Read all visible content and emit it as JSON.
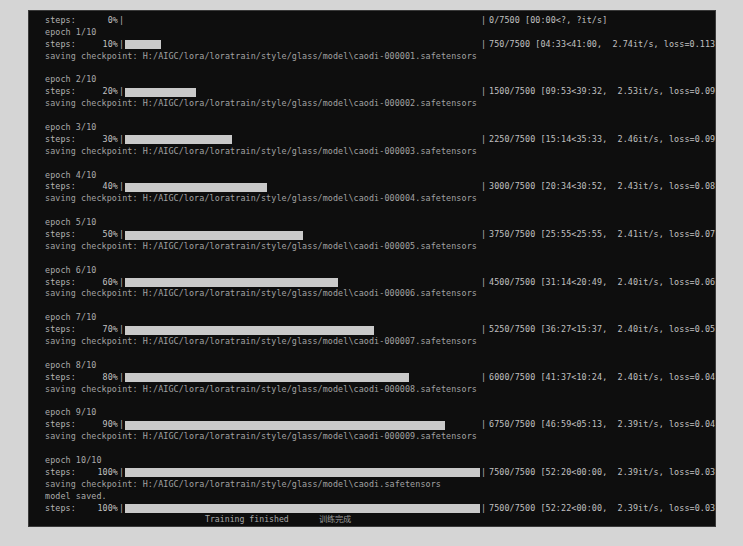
{
  "window": {
    "type": "terminal-console",
    "background_color": "#0e0e0e",
    "text_color": "#b9b9b9",
    "bar_color": "#c9c9c9"
  },
  "log": {
    "entries": [
      {
        "kind": "progress",
        "label": "steps:",
        "percent": "0%",
        "percent_value": 0,
        "bar_left": "|",
        "bar_right": "|",
        "stats": "0/7500 [00:00<?, ?it/s]"
      },
      {
        "kind": "text",
        "style": "epoch",
        "text": "epoch 1/10"
      },
      {
        "kind": "progress",
        "label": "steps:",
        "percent": "10%",
        "percent_value": 10,
        "bar_left": "|",
        "bar_right": "|",
        "stats": "750/7500 [04:33<41:00,  2.74it/s, loss=0.113]"
      },
      {
        "kind": "text",
        "style": "save",
        "text": "saving checkpoint: H:/AIGC/lora/loratrain/style/glass/model\\caodi-000001.safetensors"
      },
      {
        "kind": "blank"
      },
      {
        "kind": "text",
        "style": "epoch",
        "text": "epoch 2/10"
      },
      {
        "kind": "progress",
        "label": "steps:",
        "percent": "20%",
        "percent_value": 20,
        "bar_left": "|",
        "bar_right": "|",
        "stats": "1500/7500 [09:53<39:32,  2.53it/s, loss=0.0978]"
      },
      {
        "kind": "text",
        "style": "save",
        "text": "saving checkpoint: H:/AIGC/lora/loratrain/style/glass/model\\caodi-000002.safetensors"
      },
      {
        "kind": "blank"
      },
      {
        "kind": "text",
        "style": "epoch",
        "text": "epoch 3/10"
      },
      {
        "kind": "progress",
        "label": "steps:",
        "percent": "30%",
        "percent_value": 30,
        "bar_left": "|",
        "bar_right": "|",
        "stats": "2250/7500 [15:14<35:33,  2.46it/s, loss=0.0947]"
      },
      {
        "kind": "text",
        "style": "save",
        "text": "saving checkpoint: H:/AIGC/lora/loratrain/style/glass/model\\caodi-000003.safetensors"
      },
      {
        "kind": "blank"
      },
      {
        "kind": "text",
        "style": "epoch",
        "text": "epoch 4/10"
      },
      {
        "kind": "progress",
        "label": "steps:",
        "percent": "40%",
        "percent_value": 40,
        "bar_left": "|",
        "bar_right": "|",
        "stats": "3000/7500 [20:34<30:52,  2.43it/s, loss=0.0861]"
      },
      {
        "kind": "text",
        "style": "save",
        "text": "saving checkpoint: H:/AIGC/lora/loratrain/style/glass/model\\caodi-000004.safetensors"
      },
      {
        "kind": "blank"
      },
      {
        "kind": "text",
        "style": "epoch",
        "text": "epoch 5/10"
      },
      {
        "kind": "progress",
        "label": "steps:",
        "percent": "50%",
        "percent_value": 50,
        "bar_left": "|",
        "bar_right": "|",
        "stats": "3750/7500 [25:55<25:55,  2.41it/s, loss=0.0733]"
      },
      {
        "kind": "text",
        "style": "save",
        "text": "saving checkpoint: H:/AIGC/lora/loratrain/style/glass/model\\caodi-000005.safetensors"
      },
      {
        "kind": "blank"
      },
      {
        "kind": "text",
        "style": "epoch",
        "text": "epoch 6/10"
      },
      {
        "kind": "progress",
        "label": "steps:",
        "percent": "60%",
        "percent_value": 60,
        "bar_left": "|",
        "bar_right": "|",
        "stats": "4500/7500 [31:14<20:49,  2.40it/s, loss=0.0628]"
      },
      {
        "kind": "text",
        "style": "save",
        "text": "saving checkpoint: H:/AIGC/lora/loratrain/style/glass/model\\caodi-000006.safetensors"
      },
      {
        "kind": "blank"
      },
      {
        "kind": "text",
        "style": "epoch",
        "text": "epoch 7/10"
      },
      {
        "kind": "progress",
        "label": "steps:",
        "percent": "70%",
        "percent_value": 70,
        "bar_left": "|",
        "bar_right": "|",
        "stats": "5250/7500 [36:27<15:37,  2.40it/s, loss=0.0538]"
      },
      {
        "kind": "text",
        "style": "save",
        "text": "saving checkpoint: H:/AIGC/lora/loratrain/style/glass/model\\caodi-000007.safetensors"
      },
      {
        "kind": "blank"
      },
      {
        "kind": "text",
        "style": "epoch",
        "text": "epoch 8/10"
      },
      {
        "kind": "progress",
        "label": "steps:",
        "percent": "80%",
        "percent_value": 80,
        "bar_left": "|",
        "bar_right": "|",
        "stats": "6000/7500 [41:37<10:24,  2.40it/s, loss=0.0487]"
      },
      {
        "kind": "text",
        "style": "save",
        "text": "saving checkpoint: H:/AIGC/lora/loratrain/style/glass/model\\caodi-000008.safetensors"
      },
      {
        "kind": "blank"
      },
      {
        "kind": "text",
        "style": "epoch",
        "text": "epoch 9/10"
      },
      {
        "kind": "progress",
        "label": "steps:",
        "percent": "90%",
        "percent_value": 90,
        "bar_left": "|",
        "bar_right": "|",
        "stats": "6750/7500 [46:59<05:13,  2.39it/s, loss=0.0427]"
      },
      {
        "kind": "text",
        "style": "save",
        "text": "saving checkpoint: H:/AIGC/lora/loratrain/style/glass/model\\caodi-000009.safetensors"
      },
      {
        "kind": "blank"
      },
      {
        "kind": "text",
        "style": "epoch",
        "text": "epoch 10/10"
      },
      {
        "kind": "progress",
        "label": "steps:",
        "percent": "100%",
        "percent_value": 100,
        "bar_left": "|",
        "bar_right": "|",
        "stats": "7500/7500 [52:20<00:00,  2.39it/s, loss=0.036]"
      },
      {
        "kind": "text",
        "style": "save",
        "text": "saving checkpoint: H:/AIGC/lora/loratrain/style/glass/model\\caodi.safetensors"
      },
      {
        "kind": "text",
        "style": "msg",
        "text": "model saved."
      },
      {
        "kind": "progress",
        "label": "steps:",
        "percent": "100%",
        "percent_value": 100,
        "bar_left": "|",
        "bar_right": "|",
        "stats": "7500/7500 [52:22<00:00,  2.39it/s, loss=0.036]"
      }
    ]
  },
  "status_bar": {
    "left_text": "",
    "mid_text": "",
    "finished_text": "Training finished",
    "finished_text_cn": "训练完成"
  }
}
